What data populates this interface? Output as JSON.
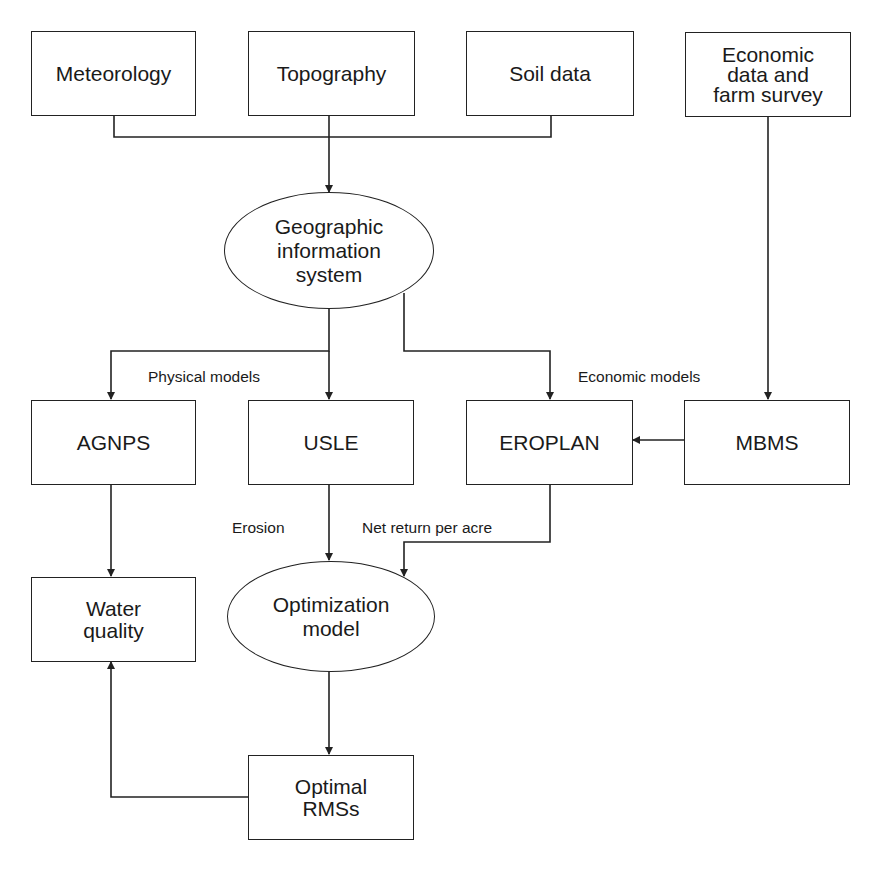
{
  "diagram": {
    "type": "flowchart",
    "nodes": {
      "meteorology": {
        "label": "Meteorology",
        "shape": "rectangle"
      },
      "topography": {
        "label": "Topography",
        "shape": "rectangle"
      },
      "soil_data": {
        "label": "Soil data",
        "shape": "rectangle"
      },
      "economic_data": {
        "label": "Economic\ndata and\nfarm survey",
        "shape": "rectangle"
      },
      "gis": {
        "label": "Geographic\ninformation\nsystem",
        "shape": "ellipse"
      },
      "agnps": {
        "label": "AGNPS",
        "shape": "rectangle"
      },
      "usle": {
        "label": "USLE",
        "shape": "rectangle"
      },
      "eroplan": {
        "label": "EROPLAN",
        "shape": "rectangle"
      },
      "mbms": {
        "label": "MBMS",
        "shape": "rectangle"
      },
      "water_quality": {
        "label": "Water\nquality",
        "shape": "rectangle"
      },
      "optimization_model": {
        "label": "Optimization\nmodel",
        "shape": "ellipse"
      },
      "optimal_rmss": {
        "label": "Optimal\nRMSs",
        "shape": "rectangle"
      }
    },
    "edge_labels": {
      "physical_models": "Physical models",
      "economic_models": "Economic models",
      "erosion": "Erosion",
      "net_return": "Net return per acre"
    },
    "edges": [
      {
        "from": "meteorology",
        "to": "gis"
      },
      {
        "from": "topography",
        "to": "gis"
      },
      {
        "from": "soil_data",
        "to": "gis"
      },
      {
        "from": "gis",
        "to": "agnps",
        "group": "Physical models"
      },
      {
        "from": "gis",
        "to": "usle",
        "group": "Physical models"
      },
      {
        "from": "gis",
        "to": "eroplan",
        "group": "Economic models"
      },
      {
        "from": "economic_data",
        "to": "mbms"
      },
      {
        "from": "mbms",
        "to": "eroplan"
      },
      {
        "from": "agnps",
        "to": "water_quality"
      },
      {
        "from": "usle",
        "to": "optimization_model",
        "label": "Erosion"
      },
      {
        "from": "eroplan",
        "to": "optimization_model",
        "label": "Net return per acre"
      },
      {
        "from": "optimization_model",
        "to": "optimal_rmss"
      },
      {
        "from": "optimal_rmss",
        "to": "water_quality"
      }
    ],
    "colors": {
      "line": "#222222",
      "background": "#ffffff",
      "text": "#1a1a1a"
    }
  }
}
